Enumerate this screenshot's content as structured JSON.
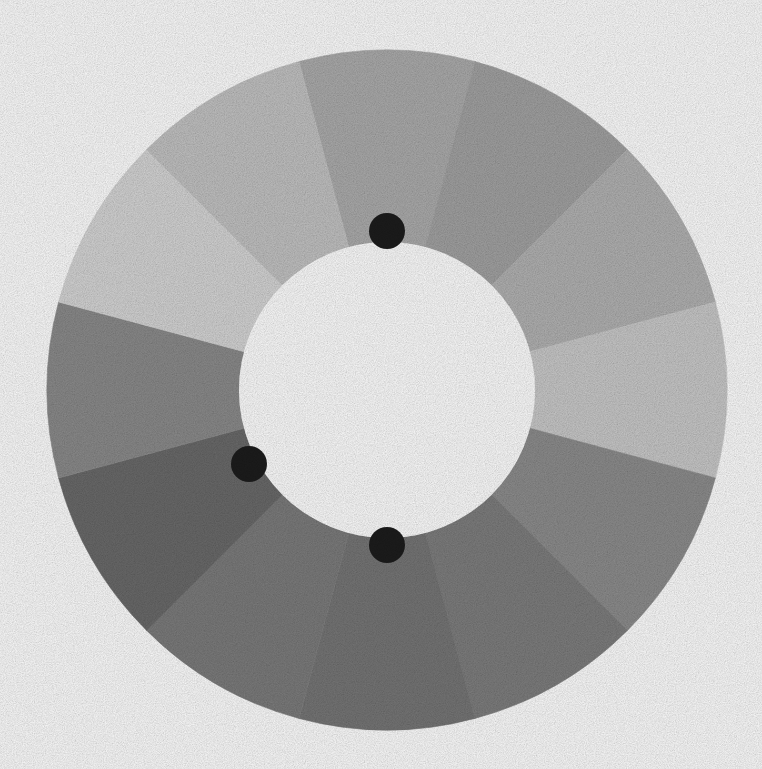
{
  "page": {
    "title": "Grayscale Donut Wheel",
    "background_color": "#ffffff",
    "width": 762,
    "height": 769
  },
  "chart_data": {
    "type": "pie",
    "variant": "donut",
    "title": "",
    "subtitle": "",
    "xlabel": "",
    "ylabel": "",
    "legend": "none",
    "grid": false,
    "center": {
      "x": 387,
      "y": 390
    },
    "outer_radius": 340,
    "inner_radius": 148,
    "inner_hole_color": "#fefefe",
    "segment_count": 12,
    "segment_span_degrees": 30,
    "angle_convention": "degrees clockwise from 12 o'clock (top)",
    "categories": [
      "seg-01",
      "seg-02",
      "seg-03",
      "seg-04",
      "seg-05",
      "seg-06",
      "seg-07",
      "seg-08",
      "seg-09",
      "seg-10",
      "seg-11",
      "seg-12"
    ],
    "values": [
      30,
      30,
      30,
      30,
      30,
      30,
      30,
      30,
      30,
      30,
      30,
      30
    ],
    "segments": [
      {
        "id": "seg-01",
        "start_deg": -15,
        "end_deg": 15,
        "color": "#acacac"
      },
      {
        "id": "seg-02",
        "start_deg": 15,
        "end_deg": 45,
        "color": "#a2a2a2"
      },
      {
        "id": "seg-03",
        "start_deg": 45,
        "end_deg": 75,
        "color": "#b2b2b2"
      },
      {
        "id": "seg-04",
        "start_deg": 75,
        "end_deg": 105,
        "color": "#c9c9c9"
      },
      {
        "id": "seg-05",
        "start_deg": 105,
        "end_deg": 135,
        "color": "#8d8d8d"
      },
      {
        "id": "seg-06",
        "start_deg": 135,
        "end_deg": 165,
        "color": "#7e7e7e"
      },
      {
        "id": "seg-07",
        "start_deg": 165,
        "end_deg": 195,
        "color": "#767676"
      },
      {
        "id": "seg-08",
        "start_deg": 195,
        "end_deg": 225,
        "color": "#7c7c7c"
      },
      {
        "id": "seg-09",
        "start_deg": 225,
        "end_deg": 255,
        "color": "#6a6a6a"
      },
      {
        "id": "seg-10",
        "start_deg": 255,
        "end_deg": 285,
        "color": "#8b8b8b"
      },
      {
        "id": "seg-11",
        "start_deg": 285,
        "end_deg": 315,
        "color": "#d5d5d5"
      },
      {
        "id": "seg-12",
        "start_deg": 315,
        "end_deg": 345,
        "color": "#c2c2c2"
      }
    ],
    "markers": {
      "color": "#1c1c1c",
      "radius": 18,
      "shape": "circle",
      "points": [
        {
          "id": "marker-top",
          "x": 387,
          "y": 231
        },
        {
          "id": "marker-left",
          "x": 249,
          "y": 464
        },
        {
          "id": "marker-bottom",
          "x": 387,
          "y": 545
        }
      ]
    }
  }
}
